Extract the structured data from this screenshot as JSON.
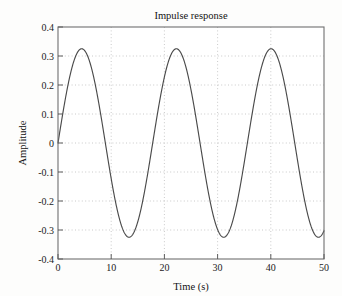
{
  "chart_data": {
    "type": "line",
    "title": "Impulse response",
    "xlabel": "Time (s)",
    "ylabel": "Amplitude",
    "xlim": [
      0,
      50
    ],
    "ylim": [
      -0.4,
      0.4
    ],
    "xticks": [
      0,
      10,
      20,
      30,
      40,
      50
    ],
    "xtick_labels": [
      "0",
      "10",
      "20",
      "30",
      "40",
      "50"
    ],
    "yticks": [
      0.4,
      0.3,
      0.2,
      0.1,
      0,
      -0.1,
      -0.2,
      -0.3,
      -0.4
    ],
    "ytick_labels": [
      "0.4",
      "0.3",
      "0.2",
      "0.1",
      "0",
      "-0.1",
      "-0.2",
      "-0.3",
      "-0.4"
    ],
    "grid": true,
    "grid_style": "dotted",
    "legend": null,
    "series": [
      {
        "name": "impulse response",
        "color": "#4a4a4a",
        "amplitude": 0.325,
        "period": 17.8,
        "phase": 0,
        "x": [
          0,
          1,
          2,
          3,
          4,
          5,
          5.7,
          6,
          7,
          8,
          9,
          10,
          11,
          12,
          13,
          14,
          14.6,
          15,
          16,
          17,
          18,
          19,
          20,
          21,
          22,
          23,
          23.5,
          24,
          25,
          26,
          27,
          28,
          29,
          30,
          31,
          32,
          32.5,
          33,
          34,
          35,
          36,
          37,
          38,
          39,
          40,
          41,
          41.3,
          42,
          43,
          44,
          45,
          46,
          47,
          48,
          49,
          50
        ],
        "y": [
          0,
          0.111,
          0.211,
          0.281,
          0.318,
          0.325,
          0.325,
          0.322,
          0.295,
          0.238,
          0.158,
          0.062,
          -0.04,
          -0.138,
          -0.224,
          -0.288,
          -0.312,
          -0.318,
          -0.325,
          -0.3,
          -0.25,
          -0.178,
          -0.086,
          0.016,
          0.118,
          0.21,
          0.253,
          0.281,
          0.319,
          0.325,
          0.3,
          0.248,
          0.17,
          0.075,
          -0.027,
          -0.126,
          -0.175,
          -0.214,
          -0.281,
          -0.318,
          -0.323,
          -0.305,
          -0.258,
          -0.188,
          -0.098,
          0.005,
          0.035,
          0.108,
          0.203,
          0.276,
          0.318,
          0.325,
          0.302,
          0.251,
          0.175,
          -0.302
        ]
      }
    ]
  },
  "axes": {
    "frame_color": "#6f6f6f",
    "grid_color": "#b9b9b9"
  }
}
